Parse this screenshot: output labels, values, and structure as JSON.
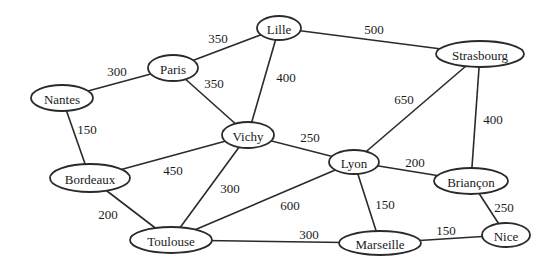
{
  "graph": {
    "nodes": [
      {
        "id": "lille",
        "label": "Lille",
        "x": 279,
        "y": 28,
        "rx": 22,
        "ry": 12
      },
      {
        "id": "strasbourg",
        "label": "Strasbourg",
        "x": 480,
        "y": 54,
        "rx": 44,
        "ry": 13
      },
      {
        "id": "paris",
        "label": "Paris",
        "x": 173,
        "y": 68,
        "rx": 25,
        "ry": 13
      },
      {
        "id": "nantes",
        "label": "Nantes",
        "x": 62,
        "y": 98,
        "rx": 31,
        "ry": 13
      },
      {
        "id": "vichy",
        "label": "Vichy",
        "x": 248,
        "y": 135,
        "rx": 26,
        "ry": 13
      },
      {
        "id": "lyon",
        "label": "Lyon",
        "x": 354,
        "y": 162,
        "rx": 25,
        "ry": 12
      },
      {
        "id": "briancon",
        "label": "Briançon",
        "x": 471,
        "y": 181,
        "rx": 37,
        "ry": 13
      },
      {
        "id": "bordeaux",
        "label": "Bordeaux",
        "x": 90,
        "y": 178,
        "rx": 40,
        "ry": 14
      },
      {
        "id": "toulouse",
        "label": "Toulouse",
        "x": 171,
        "y": 240,
        "rx": 41,
        "ry": 13
      },
      {
        "id": "marseille",
        "label": "Marseille",
        "x": 380,
        "y": 243,
        "rx": 41,
        "ry": 12
      },
      {
        "id": "nice",
        "label": "Nice",
        "x": 506,
        "y": 235,
        "rx": 24,
        "ry": 12
      }
    ],
    "edges": [
      {
        "from": "paris",
        "to": "lille",
        "weight": "350",
        "lx": 218,
        "ly": 38
      },
      {
        "from": "lille",
        "to": "strasbourg",
        "weight": "500",
        "lx": 374,
        "ly": 29
      },
      {
        "from": "nantes",
        "to": "paris",
        "weight": "300",
        "lx": 117,
        "ly": 71
      },
      {
        "from": "paris",
        "to": "vichy",
        "weight": "350",
        "lx": 214,
        "ly": 83
      },
      {
        "from": "lille",
        "to": "vichy",
        "weight": "400",
        "lx": 286,
        "ly": 77
      },
      {
        "from": "strasbourg",
        "to": "lyon",
        "weight": "650",
        "lx": 404,
        "ly": 99
      },
      {
        "from": "strasbourg",
        "to": "briancon",
        "weight": "400",
        "lx": 493,
        "ly": 119
      },
      {
        "from": "nantes",
        "to": "bordeaux",
        "weight": "150",
        "lx": 87,
        "ly": 129
      },
      {
        "from": "vichy",
        "to": "lyon",
        "weight": "250",
        "lx": 310,
        "ly": 137
      },
      {
        "from": "bordeaux",
        "to": "vichy",
        "weight": "450",
        "lx": 173,
        "ly": 170
      },
      {
        "from": "vichy",
        "to": "toulouse",
        "weight": "300",
        "lx": 230,
        "ly": 188
      },
      {
        "from": "lyon",
        "to": "briancon",
        "weight": "200",
        "lx": 415,
        "ly": 162
      },
      {
        "from": "lyon",
        "to": "toulouse",
        "weight": "600",
        "lx": 290,
        "ly": 205
      },
      {
        "from": "lyon",
        "to": "marseille",
        "weight": "150",
        "lx": 385,
        "ly": 204
      },
      {
        "from": "briancon",
        "to": "nice",
        "weight": "250",
        "lx": 504,
        "ly": 207
      },
      {
        "from": "bordeaux",
        "to": "toulouse",
        "weight": "200",
        "lx": 108,
        "ly": 214
      },
      {
        "from": "toulouse",
        "to": "marseille",
        "weight": "300",
        "lx": 309,
        "ly": 234
      },
      {
        "from": "marseille",
        "to": "nice",
        "weight": "150",
        "lx": 446,
        "ly": 230
      }
    ]
  }
}
